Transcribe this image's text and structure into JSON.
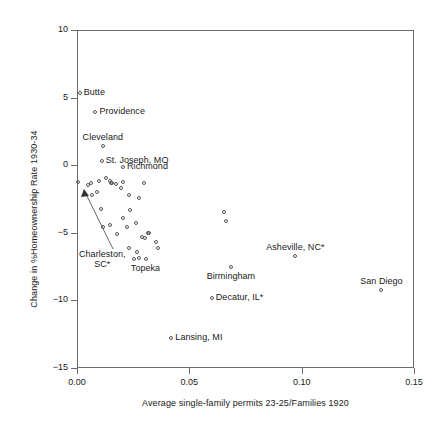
{
  "chart_data": {
    "type": "scatter",
    "title": "",
    "xlabel": "Average single-family permits 23-25/Families 1920",
    "ylabel": "Change in %Homeownership Rate 1930-34",
    "xlim": [
      0.0,
      0.15
    ],
    "ylim": [
      -15,
      10
    ],
    "xticks": [
      "0.00",
      "0.05",
      "0.10",
      "0.15"
    ],
    "xtick_values": [
      0.0,
      0.05,
      0.1,
      0.15
    ],
    "yticks": [
      "10",
      "5",
      "0",
      "−5",
      "−10",
      "−15"
    ],
    "ytick_values": [
      10,
      5,
      0,
      -5,
      -10,
      -15
    ],
    "grid": false,
    "legend": "none",
    "marker": "open-circle",
    "points": [
      {
        "x": 0.0012,
        "y": 5.35,
        "label": "Butte",
        "label_pos": "right"
      },
      {
        "x": 0.0082,
        "y": 3.95,
        "label": "Providence",
        "label_pos": "right"
      },
      {
        "x": 0.0115,
        "y": 1.45,
        "label": "Cleveland",
        "label_pos": "above"
      },
      {
        "x": 0.011,
        "y": 0.3,
        "label": "St. Joseph, MO",
        "label_pos": "right"
      },
      {
        "x": 0.0205,
        "y": -0.15,
        "label": "Richmond",
        "label_pos": "right"
      },
      {
        "x": 0.0005,
        "y": -1.25,
        "label": "Charleston, SC*",
        "label_pos": "leader"
      },
      {
        "x": 0.0685,
        "y": -7.5,
        "label": "Birmingham",
        "label_pos": "below"
      },
      {
        "x": 0.06,
        "y": -9.85,
        "label": "Decatur, IL*",
        "label_pos": "right"
      },
      {
        "x": 0.042,
        "y": -12.8,
        "label": "Lansing, MI",
        "label_pos": "right"
      },
      {
        "x": 0.0972,
        "y": -6.75,
        "label": "Asheville, NC*",
        "label_pos": "above"
      },
      {
        "x": 0.1355,
        "y": -9.25,
        "label": "San Diego",
        "label_pos": "above"
      },
      {
        "x": 0.0305,
        "y": -6.95,
        "label": "Topeka",
        "label_pos": "below"
      },
      {
        "x": 0.0048,
        "y": -1.45,
        "label": "",
        "label_pos": ""
      },
      {
        "x": 0.0062,
        "y": -1.35,
        "label": "",
        "label_pos": ""
      },
      {
        "x": 0.0065,
        "y": -2.2,
        "label": "",
        "label_pos": ""
      },
      {
        "x": 0.0098,
        "y": -1.2,
        "label": "",
        "label_pos": ""
      },
      {
        "x": 0.0128,
        "y": -0.95,
        "label": "",
        "label_pos": ""
      },
      {
        "x": 0.0148,
        "y": -1.15,
        "label": "",
        "label_pos": ""
      },
      {
        "x": 0.0152,
        "y": -1.3,
        "label": "",
        "label_pos": ""
      },
      {
        "x": 0.0158,
        "y": -1.35,
        "label": "",
        "label_pos": ""
      },
      {
        "x": 0.0175,
        "y": -1.4,
        "label": "",
        "label_pos": ""
      },
      {
        "x": 0.0205,
        "y": -1.25,
        "label": "",
        "label_pos": ""
      },
      {
        "x": 0.0088,
        "y": -1.95,
        "label": "",
        "label_pos": ""
      },
      {
        "x": 0.0195,
        "y": -1.65,
        "label": "",
        "label_pos": ""
      },
      {
        "x": 0.0232,
        "y": -2.2,
        "label": "",
        "label_pos": ""
      },
      {
        "x": 0.0298,
        "y": -1.3,
        "label": "",
        "label_pos": ""
      },
      {
        "x": 0.0278,
        "y": -2.45,
        "label": "",
        "label_pos": ""
      },
      {
        "x": 0.0108,
        "y": -3.25,
        "label": "",
        "label_pos": ""
      },
      {
        "x": 0.0238,
        "y": -3.35,
        "label": "",
        "label_pos": ""
      },
      {
        "x": 0.0205,
        "y": -3.9,
        "label": "",
        "label_pos": ""
      },
      {
        "x": 0.0262,
        "y": -4.3,
        "label": "",
        "label_pos": ""
      },
      {
        "x": 0.0115,
        "y": -4.55,
        "label": "",
        "label_pos": ""
      },
      {
        "x": 0.0148,
        "y": -4.45,
        "label": "",
        "label_pos": ""
      },
      {
        "x": 0.0178,
        "y": -5.1,
        "label": "",
        "label_pos": ""
      },
      {
        "x": 0.0222,
        "y": -4.55,
        "label": "",
        "label_pos": ""
      },
      {
        "x": 0.0288,
        "y": -5.3,
        "label": "",
        "label_pos": ""
      },
      {
        "x": 0.0302,
        "y": -5.4,
        "label": "",
        "label_pos": ""
      },
      {
        "x": 0.0318,
        "y": -5.05,
        "label": "",
        "label_pos": ""
      },
      {
        "x": 0.0322,
        "y": -5.05,
        "label": "",
        "label_pos": ""
      },
      {
        "x": 0.0352,
        "y": -5.65,
        "label": "",
        "label_pos": ""
      },
      {
        "x": 0.0232,
        "y": -6.15,
        "label": "",
        "label_pos": ""
      },
      {
        "x": 0.0268,
        "y": -6.4,
        "label": "",
        "label_pos": ""
      },
      {
        "x": 0.0362,
        "y": -6.15,
        "label": "",
        "label_pos": ""
      },
      {
        "x": 0.0252,
        "y": -6.95,
        "label": "",
        "label_pos": ""
      },
      {
        "x": 0.0275,
        "y": -6.85,
        "label": "",
        "label_pos": ""
      },
      {
        "x": 0.0655,
        "y": -3.45,
        "label": "",
        "label_pos": ""
      },
      {
        "x": 0.0665,
        "y": -4.15,
        "label": "",
        "label_pos": ""
      }
    ],
    "annotation_note": "Asterisked cities are highlighted outliers"
  },
  "figure": {
    "background": "#ffffff",
    "frame_color": "#6b6b6b",
    "marker_color": "#555555",
    "text_color": "#1a1a1a"
  }
}
